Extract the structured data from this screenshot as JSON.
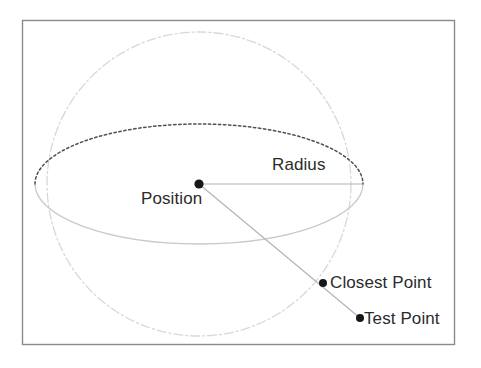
{
  "figure": {
    "background_color": "#ffffff",
    "frame": {
      "name": "diagram-border",
      "color": "#8a8a8a",
      "x": 22,
      "y": 20,
      "width": 433,
      "height": 325
    },
    "labels": {
      "radius": "Radius",
      "position": "Position",
      "closest_point": "Closest Point",
      "test_point": "Test Point"
    },
    "label_color": "#2b2b2b",
    "geometry": {
      "sphere_outline": {
        "name": "sphere-circle",
        "center_x": 199,
        "center_y": 184,
        "radius": 152,
        "stroke": "#d9d9d9",
        "style": "dash-dot"
      },
      "equator_back": {
        "name": "equator-back-arc",
        "center_x": 199,
        "center_y": 184,
        "rx": 164,
        "ry": 60,
        "stroke": "#4a4a4a",
        "style": "dotted"
      },
      "equator_front": {
        "name": "equator-front-arc",
        "center_x": 199,
        "center_y": 184,
        "rx": 164,
        "ry": 60,
        "stroke": "#c6c6c6",
        "style": "solid"
      },
      "radius_line": {
        "name": "radius-line",
        "x1": 199,
        "y1": 184,
        "x2": 362,
        "y2": 184,
        "stroke": "#b0b0b0"
      },
      "ray_line": {
        "name": "ray-line",
        "x1": 199,
        "y1": 184,
        "x2": 360,
        "y2": 318,
        "stroke": "#b0b0b0"
      },
      "points": [
        {
          "name": "position-point",
          "label": "Position",
          "x": 199,
          "y": 184,
          "r": 4.5,
          "color": "#1a1a1a"
        },
        {
          "name": "closest-point-marker",
          "label": "Closest Point",
          "x": 323,
          "y": 283,
          "r": 4.0,
          "color": "#1a1a1a"
        },
        {
          "name": "test-point-marker",
          "label": "Test Point",
          "x": 360,
          "y": 318,
          "r": 4.0,
          "color": "#1a1a1a"
        }
      ]
    }
  }
}
